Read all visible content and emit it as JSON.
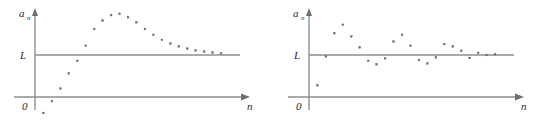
{
  "figure": {
    "background_color": "#ffffff",
    "axis_color": "#8e8e8e",
    "point_color": "#6a6a72",
    "label_color": "#2a2a2a",
    "panel_count": 2
  },
  "chart_data": [
    {
      "type": "scatter",
      "panel": "left",
      "title": "",
      "xlabel": "n",
      "ylabel": "a_n",
      "ylabel_main": "a",
      "ylabel_sub": "n",
      "origin_label": "0",
      "limit_label": "L",
      "limit_value": 1.0,
      "grid": false,
      "legend": false,
      "annotations": [
        "L"
      ],
      "description": "Sequence increasing from below, overshooting the limit L, then decreasing monotonically back toward L from above",
      "xlim": [
        0,
        24
      ],
      "ylim": [
        -0.55,
        2.35
      ],
      "x": [
        1,
        2,
        3,
        4,
        5,
        6,
        7,
        8,
        9,
        10,
        11,
        12,
        13,
        14,
        15,
        16,
        17,
        18,
        19,
        20,
        21,
        22
      ],
      "values": [
        -0.38,
        -0.1,
        0.2,
        0.56,
        0.86,
        1.22,
        1.62,
        1.82,
        1.95,
        1.98,
        1.9,
        1.78,
        1.62,
        1.48,
        1.36,
        1.27,
        1.2,
        1.15,
        1.11,
        1.08,
        1.06,
        1.04
      ]
    },
    {
      "type": "scatter",
      "panel": "right",
      "title": "",
      "xlabel": "n",
      "ylabel": "a_n",
      "ylabel_main": "a",
      "ylabel_sub": "n",
      "origin_label": "0",
      "limit_label": "L",
      "limit_value": 1.0,
      "grid": false,
      "legend": false,
      "annotations": [
        "L"
      ],
      "description": "Sequence oscillating about the limit L with decaying amplitude",
      "xlim": [
        0,
        24
      ],
      "ylim": [
        -0.55,
        2.35
      ],
      "x": [
        1,
        2,
        3,
        4,
        5,
        6,
        7,
        8,
        9,
        10,
        11,
        12,
        13,
        14,
        15,
        16,
        17,
        18,
        19,
        20,
        21,
        22
      ],
      "values": [
        0.28,
        0.96,
        1.52,
        1.72,
        1.44,
        1.18,
        0.86,
        0.78,
        0.92,
        1.32,
        1.48,
        1.22,
        0.88,
        0.8,
        0.94,
        1.26,
        1.2,
        1.1,
        0.93,
        1.05,
        1.0,
        1.02
      ]
    }
  ]
}
